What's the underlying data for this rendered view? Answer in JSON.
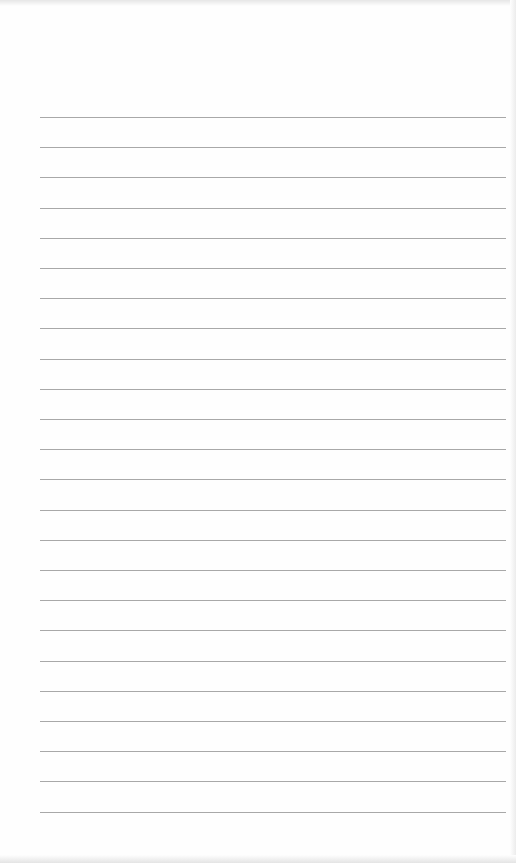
{
  "page": {
    "type": "lined-paper",
    "background": "#fefefe",
    "line_color": "#a8a8a8",
    "line_count": 24,
    "first_line_y": 117,
    "line_spacing": 30.2,
    "line_left": 40,
    "line_width": 466
  }
}
